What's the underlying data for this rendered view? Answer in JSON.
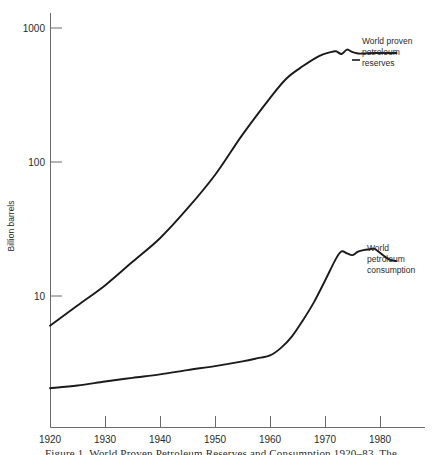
{
  "figure": {
    "caption": "Figure 1.  World Proven Petroleum Reserves and Consumption 1920–83. The",
    "background_color": "#ffffff",
    "line_color": "#1a1a1a"
  },
  "chart_data": {
    "type": "line",
    "title": "",
    "subtitle": "",
    "xlabel": "",
    "ylabel": "Billion barrels",
    "y_scale": "log",
    "ylim": [
      2,
      2000
    ],
    "xlim": [
      1920,
      1983
    ],
    "grid": false,
    "legend_position": "inline-right",
    "x_ticks": [
      "1920",
      "1930",
      "1940",
      "1950",
      "1960",
      "1970",
      "1980"
    ],
    "y_ticks": [
      "10",
      "100",
      "1000"
    ],
    "annotations": [
      {
        "id": "reserves",
        "text": "World proven\npetroleum\nreserves",
        "x": 1981,
        "y": 640
      },
      {
        "id": "consumption",
        "text": "World\npetroleum\nconsumption",
        "x": 1982,
        "y": 20
      }
    ],
    "series": [
      {
        "name": "World proven petroleum reserves",
        "color": "#1a1a1a",
        "x": [
          1920,
          1925,
          1930,
          1935,
          1940,
          1945,
          1950,
          1955,
          1960,
          1963,
          1966,
          1969,
          1971,
          1972,
          1973,
          1974,
          1975,
          1976,
          1977,
          1978,
          1979,
          1980,
          1981,
          1982,
          1983
        ],
        "y": [
          6.0,
          8.5,
          12.0,
          18.0,
          27.0,
          45.0,
          80.0,
          160.0,
          300.0,
          420.0,
          520.0,
          620.0,
          660.0,
          670.0,
          640.0,
          690.0,
          660.0,
          645.0,
          645.0,
          648.0,
          650.0,
          650.0,
          650.0,
          650.0,
          650.0
        ]
      },
      {
        "name": "World petroleum consumption",
        "color": "#1a1a1a",
        "x": [
          1920,
          1925,
          1930,
          1935,
          1940,
          1945,
          1950,
          1955,
          1958,
          1960,
          1962,
          1964,
          1966,
          1968,
          1970,
          1972,
          1973,
          1974,
          1975,
          1976,
          1977,
          1978,
          1979,
          1980,
          1981,
          1982,
          1983
        ],
        "y": [
          2.05,
          2.15,
          2.3,
          2.45,
          2.6,
          2.8,
          3.0,
          3.25,
          3.45,
          3.6,
          4.1,
          5.0,
          6.6,
          9.0,
          13.0,
          19.0,
          21.5,
          20.8,
          20.2,
          21.4,
          22.0,
          22.3,
          22.5,
          21.0,
          19.5,
          18.5,
          18.2
        ]
      }
    ]
  }
}
